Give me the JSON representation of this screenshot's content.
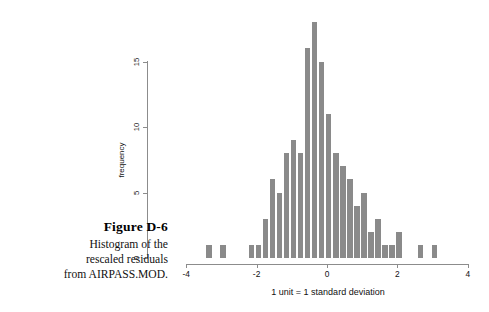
{
  "caption": {
    "figure_label": "Figure D-6",
    "lines": [
      "Histogram of the",
      "rescaled residuals",
      "from AIRPASS.MOD."
    ]
  },
  "chart_data": {
    "type": "bar",
    "title": "",
    "subtitle": "",
    "xlabel": "1 unit = 1 standard deviation",
    "ylabel": "frequency",
    "xlim": [
      -4,
      4
    ],
    "ylim": [
      0,
      18
    ],
    "xticks": [
      -4,
      -2,
      0,
      2,
      4
    ],
    "xtick_labels": [
      "-4",
      "-2",
      "0",
      "2",
      "4"
    ],
    "yticks": [
      0,
      5,
      10,
      15
    ],
    "ytick_labels": [
      "0",
      "5",
      "10",
      "15"
    ],
    "grid": false,
    "legend": null,
    "bar_color": "#8a8a8a",
    "axis_color": "#8c8c8c",
    "bin_width": 0.2,
    "categories": [
      -3.35,
      -3.15,
      -2.95,
      -2.75,
      -2.55,
      -2.35,
      -2.15,
      -1.95,
      -1.75,
      -1.55,
      -1.35,
      -1.15,
      -0.95,
      -0.75,
      -0.55,
      -0.35,
      -0.15,
      0.05,
      0.25,
      0.45,
      0.65,
      0.85,
      1.05,
      1.25,
      1.45,
      1.65,
      1.85,
      2.05,
      2.25,
      2.45,
      2.65,
      2.85,
      3.05
    ],
    "values": [
      1,
      0,
      1,
      0,
      0,
      0,
      1,
      1,
      3,
      6,
      5,
      8,
      9,
      8,
      16,
      18,
      15,
      11,
      8,
      7,
      6,
      4,
      5,
      2,
      3,
      1,
      1,
      2,
      0,
      0,
      1,
      0,
      1
    ]
  }
}
